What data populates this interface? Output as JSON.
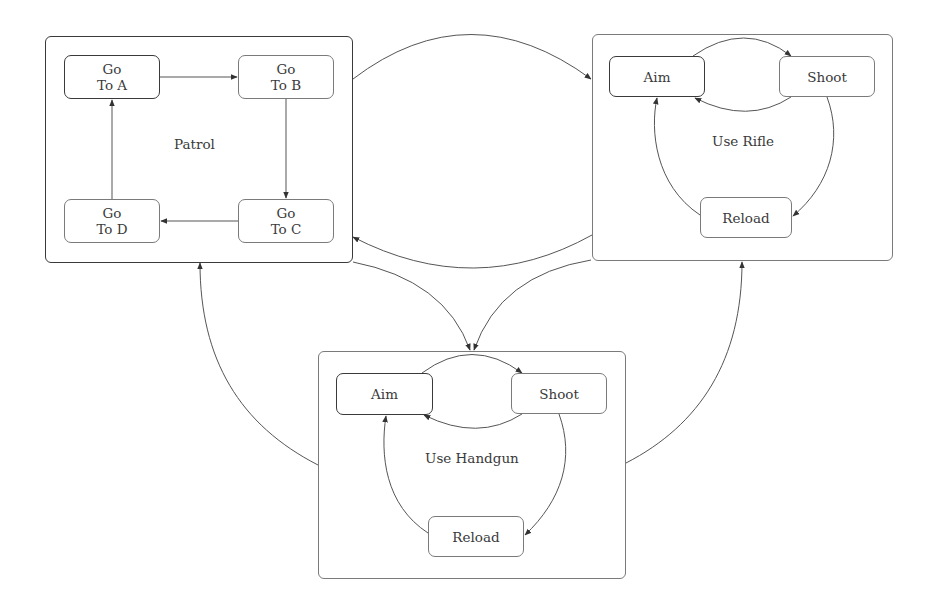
{
  "groups": {
    "patrol": {
      "label": "Patrol",
      "states": {
        "a": {
          "line1": "Go",
          "line2": "To A"
        },
        "b": {
          "line1": "Go",
          "line2": "To B"
        },
        "c": {
          "line1": "Go",
          "line2": "To C"
        },
        "d": {
          "line1": "Go",
          "line2": "To D"
        }
      }
    },
    "rifle": {
      "label": "Use Rifle",
      "states": {
        "aim": {
          "label": "Aim"
        },
        "shoot": {
          "label": "Shoot"
        },
        "reload": {
          "label": "Reload"
        }
      }
    },
    "handgun": {
      "label": "Use Handgun",
      "states": {
        "aim": {
          "label": "Aim"
        },
        "shoot": {
          "label": "Shoot"
        },
        "reload": {
          "label": "Reload"
        }
      }
    }
  },
  "edges": [
    {
      "from": "Go To A",
      "to": "Go To B"
    },
    {
      "from": "Go To B",
      "to": "Go To C"
    },
    {
      "from": "Go To C",
      "to": "Go To D"
    },
    {
      "from": "Go To D",
      "to": "Go To A"
    },
    {
      "from": "Rifle Aim",
      "to": "Rifle Shoot"
    },
    {
      "from": "Rifle Shoot",
      "to": "Rifle Aim"
    },
    {
      "from": "Rifle Shoot",
      "to": "Rifle Reload"
    },
    {
      "from": "Rifle Reload",
      "to": "Rifle Aim"
    },
    {
      "from": "Handgun Aim",
      "to": "Handgun Shoot"
    },
    {
      "from": "Handgun Shoot",
      "to": "Handgun Aim"
    },
    {
      "from": "Handgun Shoot",
      "to": "Handgun Reload"
    },
    {
      "from": "Handgun Reload",
      "to": "Handgun Aim"
    },
    {
      "from": "Patrol",
      "to": "Use Rifle"
    },
    {
      "from": "Use Rifle",
      "to": "Patrol"
    },
    {
      "from": "Patrol",
      "to": "Use Handgun"
    },
    {
      "from": "Use Rifle",
      "to": "Use Handgun"
    },
    {
      "from": "Use Handgun",
      "to": "Patrol"
    },
    {
      "from": "Use Handgun",
      "to": "Use Rifle"
    }
  ]
}
